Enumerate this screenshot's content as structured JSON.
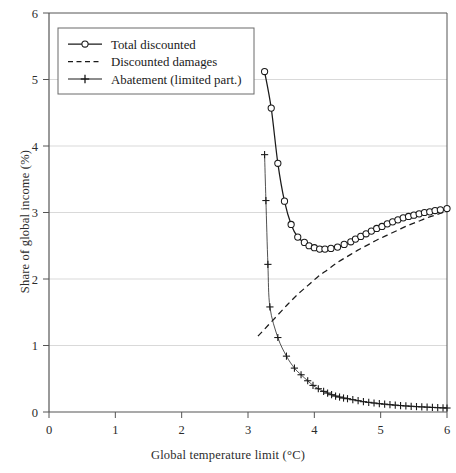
{
  "chart_data": {
    "type": "line",
    "title": "",
    "xlabel": "Global temperature limit (°C)",
    "ylabel": "Share of global income (%)",
    "xlim": [
      0,
      6
    ],
    "ylim": [
      0,
      6
    ],
    "xticks": [
      0,
      1,
      2,
      3,
      4,
      5,
      6
    ],
    "yticks": [
      0,
      1,
      2,
      3,
      4,
      5,
      6
    ],
    "xtick_labels": [
      "0",
      "1",
      "2",
      "3",
      "4",
      "5",
      "6"
    ],
    "ytick_labels": [
      "0",
      "1",
      "2",
      "3",
      "4",
      "5",
      "6"
    ],
    "grid": "horizontal",
    "legend_position": "top-left",
    "series": [
      {
        "name": "Total discounted",
        "style": "solid-with-open-circle-markers",
        "color": "#1a1a1a",
        "x": [
          3.25,
          3.35,
          3.45,
          3.55,
          3.65,
          3.75,
          3.85,
          3.92,
          4.0,
          4.08,
          4.16,
          4.25,
          4.35,
          4.45,
          4.55,
          4.62,
          4.7,
          4.78,
          4.86,
          4.94,
          5.02,
          5.1,
          5.18,
          5.26,
          5.34,
          5.42,
          5.5,
          5.58,
          5.66,
          5.74,
          5.82,
          5.9,
          6.0
        ],
        "y": [
          5.12,
          4.57,
          3.74,
          3.17,
          2.82,
          2.63,
          2.55,
          2.5,
          2.47,
          2.45,
          2.45,
          2.46,
          2.48,
          2.52,
          2.56,
          2.6,
          2.64,
          2.68,
          2.72,
          2.76,
          2.79,
          2.83,
          2.86,
          2.89,
          2.92,
          2.94,
          2.96,
          2.98,
          3.0,
          3.01,
          3.03,
          3.04,
          3.06
        ]
      },
      {
        "name": "Discounted damages",
        "style": "dashed",
        "color": "#1a1a1a",
        "x": [
          3.15,
          3.3,
          3.45,
          3.6,
          3.75,
          3.9,
          4.05,
          4.2,
          4.35,
          4.5,
          4.65,
          4.8,
          4.95,
          5.1,
          5.25,
          5.4,
          5.55,
          5.7,
          5.85,
          6.0
        ],
        "y": [
          1.14,
          1.3,
          1.46,
          1.62,
          1.77,
          1.9,
          2.03,
          2.14,
          2.25,
          2.34,
          2.43,
          2.51,
          2.59,
          2.66,
          2.73,
          2.8,
          2.86,
          2.92,
          2.97,
          3.02
        ]
      },
      {
        "name": "Abatement (limited part.)",
        "style": "solid-with-plus-markers",
        "color": "#1a1a1a",
        "x": [
          3.25,
          3.27,
          3.3,
          3.33,
          3.45,
          3.58,
          3.7,
          3.8,
          3.9,
          3.98,
          4.06,
          4.14,
          4.2,
          4.26,
          4.32,
          4.38,
          4.44,
          4.5,
          4.58,
          4.66,
          4.74,
          4.82,
          4.9,
          4.98,
          5.06,
          5.14,
          5.22,
          5.3,
          5.38,
          5.46,
          5.54,
          5.62,
          5.7,
          5.78,
          5.86,
          5.94,
          6.0
        ],
        "y": [
          3.87,
          3.18,
          2.22,
          1.58,
          1.12,
          0.84,
          0.66,
          0.56,
          0.47,
          0.4,
          0.35,
          0.31,
          0.285,
          0.26,
          0.24,
          0.225,
          0.21,
          0.2,
          0.185,
          0.17,
          0.155,
          0.145,
          0.135,
          0.125,
          0.118,
          0.11,
          0.103,
          0.097,
          0.091,
          0.086,
          0.081,
          0.077,
          0.073,
          0.069,
          0.065,
          0.062,
          0.06
        ]
      }
    ]
  },
  "legend": {
    "items": [
      {
        "label": "Total discounted",
        "marker": "open-circle"
      },
      {
        "label": "Discounted damages",
        "marker": "dashed-line"
      },
      {
        "label": "Abatement (limited part.)",
        "marker": "plus"
      }
    ]
  },
  "colors": {
    "axis": "#555555",
    "grid": "#d9d9d9",
    "series": "#1a1a1a",
    "background": "#ffffff"
  }
}
